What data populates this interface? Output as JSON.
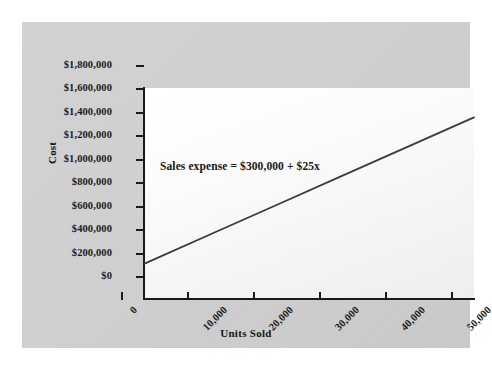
{
  "chart_data": {
    "type": "line",
    "title": "",
    "xlabel": "Units Sold",
    "ylabel": "Cost",
    "xlim": [
      0,
      50000
    ],
    "ylim": [
      0,
      1800000
    ],
    "grid": false,
    "legend": "none",
    "x_ticks": [
      "0",
      "10,000",
      "20,000",
      "30,000",
      "40,000",
      "50,000"
    ],
    "x_tick_values": [
      0,
      10000,
      20000,
      30000,
      40000,
      50000
    ],
    "y_ticks": [
      "$0",
      "$200,000",
      "$400,000",
      "$600,000",
      "$800,000",
      "$1,000,000",
      "$1,200,000",
      "$1,400,000",
      "$1,600,000",
      "$1,800,000"
    ],
    "y_tick_values": [
      0,
      200000,
      400000,
      600000,
      800000,
      1000000,
      1200000,
      1400000,
      1600000,
      1800000
    ],
    "annotations": [
      {
        "text": "Sales expense = $300,000 + $25x",
        "x": 5000,
        "y": 1000000
      }
    ],
    "series": [
      {
        "name": "Sales expense",
        "equation": "y = 300000 + 25x",
        "intercept": 300000,
        "slope": 25,
        "color": "#3a3a3a",
        "x": [
          0,
          10000,
          20000,
          30000,
          40000,
          50000
        ],
        "values": [
          300000,
          550000,
          800000,
          1050000,
          1300000,
          1550000
        ]
      }
    ]
  },
  "colors": {
    "panel_background": "#cfcfcf",
    "plot_background": "#fbfbfb",
    "axis": "#1a1a1a",
    "line": "#3a3a3a",
    "text": "#1b1b1b"
  }
}
